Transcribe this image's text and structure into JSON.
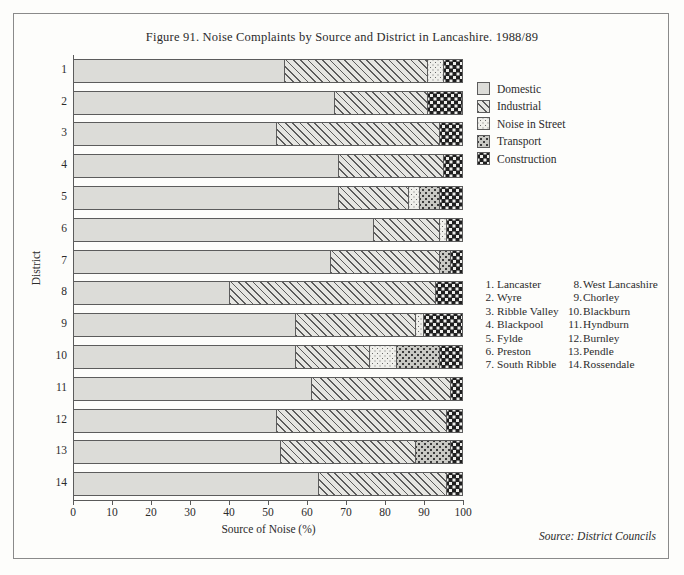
{
  "figure": {
    "title": "Figure 91.  Noise Complaints by Source and District in Lancashire. 1988/89",
    "source_note": "Source: District Councils"
  },
  "axes": {
    "xlabel": "Source of Noise (%)",
    "ylabel": "District",
    "xticks": [
      "0",
      "10",
      "20",
      "30",
      "40",
      "50",
      "60",
      "70",
      "80",
      "90",
      "100"
    ],
    "yticks": [
      "1",
      "2",
      "3",
      "4",
      "5",
      "6",
      "7",
      "8",
      "9",
      "10",
      "11",
      "12",
      "13",
      "14"
    ]
  },
  "legend": {
    "items": [
      {
        "label": "Domestic",
        "swatch": "f-domestic",
        "color": "#dcdcd8"
      },
      {
        "label": "Industrial",
        "swatch": "f-industrial",
        "color": "#e6e6e2"
      },
      {
        "label": "Noise in Street",
        "swatch": "f-street",
        "color": "#efefeb"
      },
      {
        "label": "Transport",
        "swatch": "f-transport",
        "color": "#c9c9c4"
      },
      {
        "label": "Construction",
        "swatch": "f-construction",
        "color": "#1f1f1f"
      }
    ]
  },
  "district_key": {
    "left": [
      {
        "num": "1.",
        "name": "Lancaster"
      },
      {
        "num": "2.",
        "name": "Wyre"
      },
      {
        "num": "3.",
        "name": "Ribble Valley"
      },
      {
        "num": "4.",
        "name": "Blackpool"
      },
      {
        "num": "5.",
        "name": "Fylde"
      },
      {
        "num": "6.",
        "name": "Preston"
      },
      {
        "num": "7.",
        "name": "South Ribble"
      }
    ],
    "right": [
      {
        "num": "8.",
        "name": "West Lancashire"
      },
      {
        "num": "9.",
        "name": "Chorley"
      },
      {
        "num": "10.",
        "name": "Blackburn"
      },
      {
        "num": "11.",
        "name": "Hyndburn"
      },
      {
        "num": "12.",
        "name": "Burnley"
      },
      {
        "num": "13.",
        "name": "Pendle"
      },
      {
        "num": "14.",
        "name": "Rossendale"
      }
    ]
  },
  "chart_data": {
    "type": "bar",
    "orientation": "horizontal",
    "stacked": true,
    "title": "Figure 91.  Noise Complaints by Source and District in Lancashire. 1988/89",
    "xlabel": "Source of Noise (%)",
    "ylabel": "District",
    "xlim": [
      0,
      100
    ],
    "xticks": [
      0,
      10,
      20,
      30,
      40,
      50,
      60,
      70,
      80,
      90,
      100
    ],
    "grid": false,
    "legend_position": "right-top",
    "categories": [
      "1",
      "2",
      "3",
      "4",
      "5",
      "6",
      "7",
      "8",
      "9",
      "10",
      "11",
      "12",
      "13",
      "14"
    ],
    "category_names": [
      "Lancaster",
      "Wyre",
      "Ribble Valley",
      "Blackpool",
      "Fylde",
      "Preston",
      "South Ribble",
      "West Lancashire",
      "Chorley",
      "Blackburn",
      "Hyndburn",
      "Burnley",
      "Pendle",
      "Rossendale"
    ],
    "series": [
      {
        "name": "Domestic",
        "values": [
          54,
          67,
          52,
          68,
          68,
          77,
          66,
          40,
          57,
          57,
          61,
          52,
          53,
          63
        ]
      },
      {
        "name": "Industrial",
        "values": [
          37,
          24,
          42,
          27,
          18,
          17,
          28,
          53,
          31,
          19,
          36,
          44,
          35,
          33
        ]
      },
      {
        "name": "Noise in Street",
        "values": [
          4,
          0,
          0,
          0,
          3,
          2,
          0,
          0,
          2,
          7,
          0,
          0,
          0,
          0
        ]
      },
      {
        "name": "Transport",
        "values": [
          0,
          0,
          0,
          0,
          5,
          0,
          3,
          0,
          0,
          11,
          0,
          0,
          9,
          0
        ]
      },
      {
        "name": "Construction",
        "values": [
          5,
          9,
          6,
          5,
          6,
          4,
          3,
          7,
          10,
          6,
          3,
          4,
          3,
          4
        ]
      }
    ]
  },
  "bars": [
    {
      "district": "1",
      "segments": [
        {
          "cls": "f-domestic",
          "pct": 54
        },
        {
          "cls": "f-industrial",
          "pct": 37
        },
        {
          "cls": "f-street",
          "pct": 4
        },
        {
          "cls": "f-construction",
          "pct": 5
        }
      ]
    },
    {
      "district": "2",
      "segments": [
        {
          "cls": "f-domestic",
          "pct": 67
        },
        {
          "cls": "f-industrial",
          "pct": 24
        },
        {
          "cls": "f-construction",
          "pct": 9
        }
      ]
    },
    {
      "district": "3",
      "segments": [
        {
          "cls": "f-domestic",
          "pct": 52
        },
        {
          "cls": "f-industrial",
          "pct": 42
        },
        {
          "cls": "f-construction",
          "pct": 6
        }
      ]
    },
    {
      "district": "4",
      "segments": [
        {
          "cls": "f-domestic",
          "pct": 68
        },
        {
          "cls": "f-industrial",
          "pct": 27
        },
        {
          "cls": "f-construction",
          "pct": 5
        }
      ]
    },
    {
      "district": "5",
      "segments": [
        {
          "cls": "f-domestic",
          "pct": 68
        },
        {
          "cls": "f-industrial",
          "pct": 18
        },
        {
          "cls": "f-street",
          "pct": 3
        },
        {
          "cls": "f-transport",
          "pct": 5
        },
        {
          "cls": "f-construction",
          "pct": 6
        }
      ]
    },
    {
      "district": "6",
      "segments": [
        {
          "cls": "f-domestic",
          "pct": 77
        },
        {
          "cls": "f-industrial",
          "pct": 17
        },
        {
          "cls": "f-street",
          "pct": 2
        },
        {
          "cls": "f-construction",
          "pct": 4
        }
      ]
    },
    {
      "district": "7",
      "segments": [
        {
          "cls": "f-domestic",
          "pct": 66
        },
        {
          "cls": "f-industrial",
          "pct": 28
        },
        {
          "cls": "f-transport",
          "pct": 3
        },
        {
          "cls": "f-construction",
          "pct": 3
        }
      ]
    },
    {
      "district": "8",
      "segments": [
        {
          "cls": "f-domestic",
          "pct": 40
        },
        {
          "cls": "f-industrial",
          "pct": 53
        },
        {
          "cls": "f-construction",
          "pct": 7
        }
      ]
    },
    {
      "district": "9",
      "segments": [
        {
          "cls": "f-domestic",
          "pct": 57
        },
        {
          "cls": "f-industrial",
          "pct": 31
        },
        {
          "cls": "f-street",
          "pct": 2
        },
        {
          "cls": "f-construction",
          "pct": 10
        }
      ]
    },
    {
      "district": "10",
      "segments": [
        {
          "cls": "f-domestic",
          "pct": 57
        },
        {
          "cls": "f-industrial",
          "pct": 19
        },
        {
          "cls": "f-street",
          "pct": 7
        },
        {
          "cls": "f-transport",
          "pct": 11
        },
        {
          "cls": "f-construction",
          "pct": 6
        }
      ]
    },
    {
      "district": "11",
      "segments": [
        {
          "cls": "f-domestic",
          "pct": 61
        },
        {
          "cls": "f-industrial",
          "pct": 36
        },
        {
          "cls": "f-construction",
          "pct": 3
        }
      ]
    },
    {
      "district": "12",
      "segments": [
        {
          "cls": "f-domestic",
          "pct": 52
        },
        {
          "cls": "f-industrial",
          "pct": 44
        },
        {
          "cls": "f-construction",
          "pct": 4
        }
      ]
    },
    {
      "district": "13",
      "segments": [
        {
          "cls": "f-domestic",
          "pct": 53
        },
        {
          "cls": "f-industrial",
          "pct": 35
        },
        {
          "cls": "f-transport",
          "pct": 9
        },
        {
          "cls": "f-construction",
          "pct": 3
        }
      ]
    },
    {
      "district": "14",
      "segments": [
        {
          "cls": "f-domestic",
          "pct": 63
        },
        {
          "cls": "f-industrial",
          "pct": 33
        },
        {
          "cls": "f-construction",
          "pct": 4
        }
      ]
    }
  ]
}
